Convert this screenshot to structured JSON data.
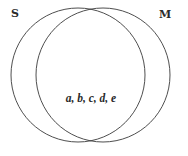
{
  "diagram": {
    "type": "venn",
    "sets": [
      {
        "id": "S",
        "label": "S",
        "cx": 78,
        "cy": 75,
        "r": 67
      },
      {
        "id": "M",
        "label": "M",
        "cx": 103,
        "cy": 75,
        "r": 67
      }
    ],
    "regions": [
      {
        "sets": [
          "S",
          "M"
        ],
        "text": "a, b, c, d, e"
      }
    ],
    "stroke_color": "#3a3a3a"
  }
}
